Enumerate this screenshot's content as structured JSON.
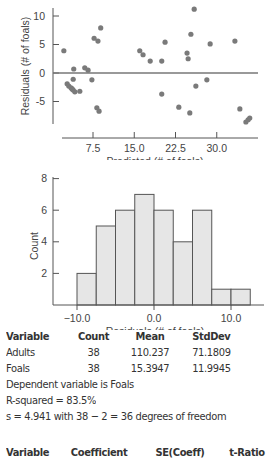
{
  "chart_data": [
    {
      "type": "scatter",
      "title": "",
      "xlabel": "Predicted (# of foals)",
      "ylabel": "Residuals (# of foals)",
      "xticks": [
        7.5,
        15.0,
        22.5,
        30.0
      ],
      "xtick_labels": [
        "7.5",
        "15.0",
        "22.5",
        "30.0"
      ],
      "yticks": [
        -5,
        0,
        5,
        10
      ],
      "ytick_labels": [
        "-5",
        "0",
        "5",
        "10"
      ],
      "xlim": [
        0,
        37
      ],
      "ylim": [
        -9,
        11.5
      ],
      "reference_line_y": 0,
      "grid": false,
      "points": [
        [
          2.2,
          3.9
        ],
        [
          4.0,
          0.7
        ],
        [
          3.9,
          -1.1
        ],
        [
          2.8,
          -1.9
        ],
        [
          3.1,
          -2.3
        ],
        [
          3.5,
          -2.6
        ],
        [
          3.9,
          -3.0
        ],
        [
          4.2,
          -3.3
        ],
        [
          5.1,
          -3.2
        ],
        [
          6.0,
          0.9
        ],
        [
          6.6,
          0.5
        ],
        [
          7.3,
          -1.2
        ],
        [
          7.7,
          6.1
        ],
        [
          8.4,
          5.6
        ],
        [
          8.9,
          7.9
        ],
        [
          8.2,
          -6.1
        ],
        [
          8.6,
          -6.7
        ],
        [
          16.0,
          3.9
        ],
        [
          16.6,
          3.2
        ],
        [
          17.9,
          2.1
        ],
        [
          20.0,
          -3.7
        ],
        [
          20.0,
          2.1
        ],
        [
          20.6,
          5.4
        ],
        [
          23.1,
          -6.0
        ],
        [
          24.6,
          3.5
        ],
        [
          24.8,
          2.5
        ],
        [
          25.1,
          -7.0
        ],
        [
          25.3,
          6.8
        ],
        [
          25.9,
          11.2
        ],
        [
          26.2,
          -2.3
        ],
        [
          28.2,
          -1.2
        ],
        [
          28.8,
          5.1
        ],
        [
          33.3,
          5.6
        ],
        [
          34.2,
          -6.3
        ],
        [
          35.3,
          -8.6
        ],
        [
          35.7,
          -8.2
        ],
        [
          36.0,
          -7.9
        ],
        [
          3.7,
          -2.8
        ]
      ]
    },
    {
      "type": "bar",
      "subtype": "histogram",
      "title": "",
      "xlabel": "Residuals (# of foals)",
      "ylabel": "Count",
      "xticks": [
        -10.0,
        0.0,
        10.0
      ],
      "xtick_labels": [
        "-10.0",
        "0.0",
        "10.0"
      ],
      "yticks": [
        2,
        4,
        6,
        8
      ],
      "ytick_labels": [
        "2",
        "4",
        "6",
        "8"
      ],
      "ylim": [
        0,
        8
      ],
      "bin_width": 2.5,
      "bin_edges": [
        -10.0,
        -7.5,
        -5.0,
        -2.5,
        0.0,
        2.5,
        5.0,
        7.5,
        10.0,
        12.5
      ],
      "categories": [
        "-10 to -7.5",
        "-7.5 to -5",
        "-5 to -2.5",
        "-2.5 to 0",
        "0 to 2.5",
        "2.5 to 5",
        "5 to 7.5",
        "7.5 to 10",
        "10 to 12.5"
      ],
      "values": [
        2,
        5,
        6,
        7,
        6,
        4,
        6,
        1,
        1
      ],
      "grid": false
    }
  ],
  "summary_table": {
    "headers": [
      "Variable",
      "Count",
      "Mean",
      "StdDev"
    ],
    "rows": [
      [
        "Adults",
        "38",
        "110.237",
        "71.1809"
      ],
      [
        "Foals",
        "38",
        "15.3947",
        "11.9945"
      ]
    ]
  },
  "regression": {
    "dependent": "Dependent variable is Foals",
    "r_squared": "R-squared  =  83.5%",
    "s_line": "s  =  4.941 with 38  −  2  =  36 degrees of freedom"
  },
  "coef_table": {
    "headers": [
      "Variable",
      "Coefficient",
      "SE(Coeff)",
      "t-Ratio",
      "P"
    ]
  }
}
